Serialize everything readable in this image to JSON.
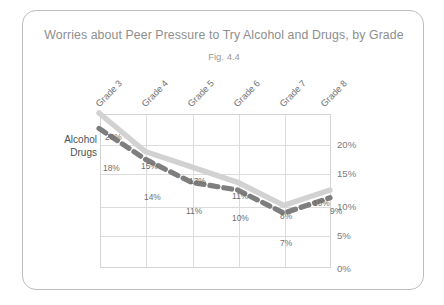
{
  "card": {
    "title": "Worries about Peer Pressure to Try Alcohol and Drugs, by Grade",
    "subtitle": "Fig. 4.4"
  },
  "legend": {
    "alcohol_label": "Alcohol",
    "drugs_label": "Drugs"
  },
  "axis": {
    "y_ticks": [
      "20%",
      "15%",
      "10%",
      "5%",
      "0%"
    ],
    "x_ticks": [
      "Grade 3",
      "Grade 4",
      "Grade 5",
      "Grade 6",
      "Grade 7",
      "Grade 8"
    ]
  },
  "labels": {
    "alcohol": [
      "20%",
      "15%",
      "13%",
      "11%",
      "8%",
      "10%"
    ],
    "drugs": [
      "18%",
      "14%",
      "11%",
      "10%",
      "7%",
      "9%"
    ]
  },
  "colors": {
    "alcohol_line": "#d2d2d2",
    "drugs_line": "#7e7e7e",
    "grid": "#dcdcdc",
    "card_border": "#bdbdbd",
    "title_text": "#8e8e8e"
  },
  "chart_data": {
    "type": "line",
    "title": "Worries about Peer Pressure to Try Alcohol and Drugs, by Grade",
    "subtitle": "Fig. 4.4",
    "xlabel": "",
    "ylabel": "",
    "categories": [
      "Grade 3",
      "Grade 4",
      "Grade 5",
      "Grade 6",
      "Grade 7",
      "Grade 8"
    ],
    "series": [
      {
        "name": "Alcohol",
        "values": [
          20,
          15,
          13,
          11,
          8,
          10
        ],
        "style": "solid",
        "color": "#d2d2d2"
      },
      {
        "name": "Drugs",
        "values": [
          18,
          14,
          11,
          10,
          7,
          9
        ],
        "style": "dashed",
        "color": "#7e7e7e"
      }
    ],
    "ylim": [
      0,
      20
    ],
    "yticks": [
      0,
      5,
      10,
      15,
      20
    ],
    "ytick_labels": [
      "0%",
      "5%",
      "10%",
      "15%",
      "20%"
    ],
    "y_axis_position": "right",
    "grid": true,
    "legend_position": "left-inline",
    "data_labels": true,
    "units": "percent"
  }
}
